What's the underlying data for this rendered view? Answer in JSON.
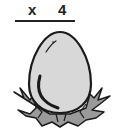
{
  "equation": {
    "operator": "x",
    "multiplier": "4"
  },
  "illustration": {
    "subject": "egg-in-nest",
    "colors": {
      "egg_fill": "#d8d8d8",
      "nest_fill": "#9a9a9a",
      "outline": "#1a1a1a"
    }
  }
}
